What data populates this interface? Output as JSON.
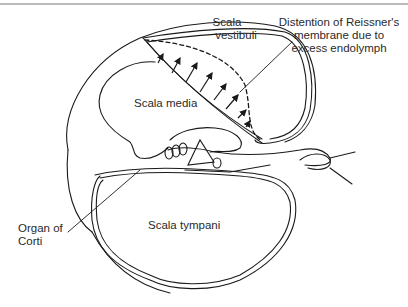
{
  "diagram": {
    "labels": {
      "scala_vestibuli_1": "Scala",
      "scala_vestibuli_2": "vestibuli",
      "scala_media": "Scala media",
      "scala_tympani": "Scala tympani",
      "distention_1": "Distention of Reissner's",
      "distention_2": "membrane due to",
      "distention_3": "excess endolymph",
      "organ_1": "Organ of",
      "organ_2": "Corti"
    },
    "colors": {
      "line": "#1a1a1a",
      "rule": "#777777",
      "background": "#ffffff"
    }
  }
}
